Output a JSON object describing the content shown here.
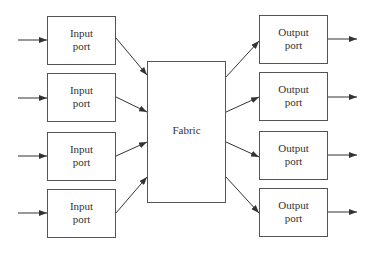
{
  "diagram": {
    "type": "switch-architecture",
    "inputs": [
      {
        "label_line1": "Input",
        "label_line2": "port"
      },
      {
        "label_line1": "Input",
        "label_line2": "port"
      },
      {
        "label_line1": "Input",
        "label_line2": "port"
      },
      {
        "label_line1": "Input",
        "label_line2": "port"
      }
    ],
    "fabric": {
      "label": "Fabric"
    },
    "outputs": [
      {
        "label_line1": "Output",
        "label_line2": "port"
      },
      {
        "label_line1": "Output",
        "label_line2": "port"
      },
      {
        "label_line1": "Output",
        "label_line2": "port"
      },
      {
        "label_line1": "Output",
        "label_line2": "port"
      }
    ],
    "colors": {
      "stroke": "#555555",
      "background": "#ffffff",
      "text": "#333333"
    }
  }
}
